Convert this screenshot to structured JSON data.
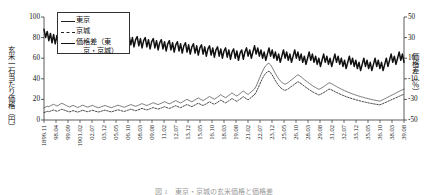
{
  "chart_data": {
    "type": "line",
    "title": "",
    "xlabel": "",
    "ylabel": "玄米一石当たり価格（円）",
    "ylabel_right": "価格差（％）",
    "ylim": [
      0,
      100
    ],
    "yticks": [
      "0",
      "20",
      "40",
      "60",
      "80",
      "100"
    ],
    "ylim_right": [
      -50,
      50
    ],
    "yticks_right": [
      "-50",
      "-30",
      "-10",
      "10",
      "30",
      "50"
    ],
    "grid": false,
    "legend_position": "upper-left-inside",
    "x_tick_labels": [
      "1896.11",
      "98.04",
      "99.09",
      "1901.02",
      "02.07",
      "03.12",
      "05.05",
      "06.10",
      "08.03",
      "09.08",
      "11.02",
      "12.07",
      "13.12",
      "15.05",
      "16.10",
      "18.03",
      "19.08",
      "21.02",
      "22.07",
      "23.12",
      "25.05",
      "26.10",
      "28.03",
      "29.08",
      "31.02",
      "32.07",
      "33.12",
      "35.05",
      "36.10",
      "38.03",
      "39.08"
    ],
    "series": [
      {
        "name": "東京",
        "axis": "left",
        "style": "thin-solid",
        "color": "#444444",
        "values": [
          11.8,
          12.6,
          13.4,
          12.9,
          13.8,
          14.6,
          15.2,
          14.4,
          13.6,
          14.2,
          15.4,
          16.2,
          15.6,
          14.8,
          13.9,
          13.2,
          12.6,
          13.4,
          14.2,
          13.6,
          12.8,
          12.2,
          12.8,
          13.6,
          14.4,
          13.8,
          13.1,
          12.6,
          12.9,
          13.5,
          14.2,
          13.6,
          12.9,
          12.4,
          11.9,
          12.4,
          13.0,
          13.6,
          14.1,
          13.5,
          12.9,
          12.4,
          12.0,
          12.6,
          13.2,
          13.8,
          14.4,
          13.9,
          13.3,
          12.8,
          12.4,
          13.0,
          13.7,
          14.3,
          15.0,
          14.4,
          13.8,
          13.3,
          13.8,
          14.5,
          15.2,
          15.9,
          15.2,
          14.6,
          14.1,
          14.7,
          15.4,
          16.1,
          16.8,
          16.1,
          15.5,
          15.0,
          15.6,
          16.3,
          17.0,
          17.8,
          17.0,
          16.3,
          15.7,
          16.4,
          17.2,
          18.0,
          18.8,
          18.0,
          17.2,
          16.6,
          17.4,
          18.3,
          19.2,
          20.1,
          19.2,
          18.4,
          17.7,
          18.6,
          19.5,
          20.5,
          21.4,
          20.5,
          19.6,
          18.9,
          19.8,
          20.8,
          21.8,
          22.9,
          21.9,
          21.0,
          20.2,
          21.2,
          22.3,
          23.4,
          24.6,
          23.5,
          22.5,
          21.6,
          22.7,
          23.9,
          25.1,
          26.3,
          25.2,
          24.1,
          23.2,
          24.4,
          25.6,
          26.9,
          28.2,
          27.0,
          25.8,
          24.8,
          26.1,
          27.4,
          28.8,
          30.2,
          32.8,
          36.5,
          40.2,
          44.0,
          47.5,
          50.5,
          52.8,
          54.2,
          55.0,
          53.5,
          51.0,
          48.0,
          45.0,
          42.5,
          40.0,
          38.0,
          36.5,
          35.5,
          34.8,
          35.5,
          36.5,
          37.8,
          39.0,
          40.2,
          41.5,
          42.8,
          44.0,
          43.0,
          41.8,
          40.5,
          39.2,
          38.0,
          36.8,
          35.6,
          34.5,
          33.4,
          32.4,
          31.5,
          30.6,
          29.8,
          30.5,
          31.4,
          32.4,
          33.5,
          34.6,
          35.8,
          36.0,
          35.2,
          34.3,
          33.4,
          32.5,
          31.6,
          30.8,
          30.0,
          29.2,
          28.5,
          27.8,
          27.1,
          26.5,
          25.9,
          25.3,
          24.8,
          24.2,
          23.7,
          23.2,
          22.7,
          22.3,
          21.8,
          21.4,
          21.0,
          20.6,
          20.2,
          19.9,
          19.5,
          19.2,
          18.9,
          18.6,
          18.3,
          19.0,
          19.8,
          20.6,
          21.4,
          22.2,
          23.0,
          23.8,
          24.6,
          25.4,
          26.2,
          27.0,
          27.8,
          28.6,
          29.4,
          30.0
        ]
      },
      {
        "name": "京城",
        "axis": "left",
        "style": "dashed",
        "color": "#222222",
        "values": [
          7.2,
          7.8,
          8.4,
          8.0,
          8.6,
          9.2,
          9.7,
          9.1,
          8.5,
          9.0,
          9.8,
          10.4,
          10.0,
          9.4,
          8.8,
          8.3,
          7.9,
          8.5,
          9.1,
          8.7,
          8.1,
          7.7,
          8.2,
          8.8,
          9.4,
          9.0,
          8.5,
          8.1,
          8.4,
          8.9,
          9.4,
          9.0,
          8.5,
          8.1,
          7.8,
          8.2,
          8.7,
          9.2,
          9.6,
          9.1,
          8.6,
          8.2,
          7.9,
          8.4,
          8.9,
          9.4,
          9.9,
          9.5,
          9.0,
          8.6,
          8.3,
          8.8,
          9.4,
          9.9,
          10.5,
          10.0,
          9.5,
          9.1,
          9.5,
          10.1,
          10.7,
          11.3,
          10.7,
          10.2,
          9.8,
          10.3,
          10.9,
          11.5,
          12.1,
          11.5,
          11.0,
          10.6,
          11.1,
          11.7,
          12.3,
          13.0,
          12.3,
          11.7,
          11.2,
          11.8,
          12.5,
          13.2,
          13.9,
          13.2,
          12.5,
          12.0,
          12.7,
          13.5,
          14.3,
          15.1,
          14.3,
          13.6,
          13.0,
          13.8,
          14.6,
          15.5,
          16.3,
          15.5,
          14.7,
          14.1,
          14.9,
          15.8,
          16.7,
          17.7,
          16.8,
          16.0,
          15.3,
          16.2,
          17.2,
          18.2,
          19.3,
          18.3,
          17.4,
          16.6,
          17.6,
          18.7,
          19.8,
          20.9,
          19.9,
          18.9,
          18.1,
          19.2,
          20.3,
          21.5,
          22.7,
          21.6,
          20.5,
          19.6,
          20.8,
          22.0,
          23.3,
          24.6,
          27.0,
          30.4,
          33.8,
          37.3,
          40.5,
          43.3,
          45.4,
          46.7,
          47.4,
          46.0,
          43.7,
          40.9,
          38.1,
          35.8,
          33.5,
          31.7,
          30.3,
          29.4,
          28.8,
          29.4,
          30.3,
          31.5,
          32.6,
          33.7,
          34.9,
          36.1,
          37.2,
          36.3,
          35.2,
          34.0,
          32.8,
          31.7,
          30.6,
          29.5,
          28.5,
          27.5,
          26.6,
          25.8,
          25.0,
          24.3,
          24.9,
          25.7,
          26.6,
          27.6,
          28.6,
          29.7,
          29.9,
          29.2,
          28.4,
          27.6,
          26.8,
          26.0,
          25.3,
          24.6,
          23.9,
          23.3,
          22.7,
          22.1,
          21.6,
          21.1,
          20.6,
          20.1,
          19.6,
          19.2,
          18.8,
          18.4,
          18.0,
          17.6,
          17.3,
          16.9,
          16.6,
          16.3,
          16.0,
          15.7,
          15.4,
          15.2,
          14.9,
          14.7,
          15.3,
          16.0,
          16.7,
          17.4,
          18.1,
          18.8,
          19.5,
          20.2,
          20.9,
          21.6,
          22.3,
          23.0,
          23.7,
          24.4,
          25.0
        ]
      },
      {
        "name": "価格差（東京・京城）",
        "axis": "right",
        "style": "thick-solid",
        "color": "#111111",
        "values": [
          38,
          30,
          36,
          27,
          34,
          25,
          33,
          24,
          32,
          23,
          35,
          26,
          34,
          24,
          31,
          22,
          30,
          21,
          29,
          33,
          24,
          32,
          22,
          31,
          21,
          30,
          36,
          26,
          34,
          24,
          33,
          23,
          31,
          22,
          36,
          27,
          34,
          25,
          32,
          23,
          30,
          34,
          25,
          33,
          24,
          31,
          22,
          29,
          33,
          24,
          31,
          22,
          29,
          32,
          23,
          30,
          21,
          28,
          31,
          22,
          29,
          20,
          27,
          30,
          21,
          28,
          19,
          26,
          29,
          20,
          27,
          18,
          25,
          28,
          19,
          26,
          17,
          24,
          27,
          18,
          25,
          16,
          23,
          26,
          17,
          24,
          15,
          22,
          25,
          16,
          23,
          14,
          21,
          24,
          15,
          22,
          13,
          20,
          23,
          14,
          21,
          12,
          19,
          22,
          13,
          20,
          11,
          18,
          21,
          12,
          19,
          10,
          17,
          20,
          11,
          18,
          9,
          16,
          19,
          10,
          17,
          8,
          15,
          18,
          9,
          16,
          20,
          12,
          18,
          10,
          16,
          22,
          14,
          20,
          12,
          18,
          10,
          16,
          8,
          14,
          20,
          12,
          18,
          10,
          16,
          8,
          14,
          6,
          12,
          18,
          10,
          16,
          8,
          14,
          6,
          12,
          18,
          10,
          16,
          8,
          14,
          6,
          12,
          4,
          10,
          16,
          8,
          14,
          6,
          12,
          4,
          10,
          2,
          8,
          14,
          6,
          12,
          4,
          10,
          2,
          8,
          14,
          6,
          12,
          4,
          10,
          2,
          8,
          0,
          6,
          12,
          4,
          10,
          2,
          8,
          0,
          6,
          -2,
          4,
          10,
          2,
          8,
          0,
          6,
          -2,
          4,
          10,
          2,
          8,
          0,
          6,
          -2,
          4,
          10,
          2,
          8,
          14,
          6,
          12,
          4,
          10,
          16,
          8,
          14,
          6
        ]
      }
    ]
  },
  "legend": {
    "items": [
      {
        "label": "東京",
        "key": "thin-solid"
      },
      {
        "label": "京城",
        "key": "dashed"
      },
      {
        "label_line1": "価格差（東",
        "label_line2": "京・京城）",
        "key": "thick-solid"
      }
    ]
  },
  "caption": {
    "text": "図 1　東京・京城の玄米価格と価格差"
  }
}
